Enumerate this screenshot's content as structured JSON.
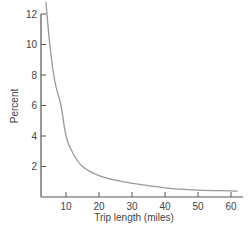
{
  "chart_data": {
    "type": "line",
    "title": "",
    "xlabel": "Trip length (miles)",
    "ylabel": "Percent",
    "xlim": [
      2.4,
      62
    ],
    "ylim": [
      0,
      12.5
    ],
    "x_ticks": [
      10,
      20,
      30,
      40,
      50,
      60
    ],
    "y_ticks": [
      2,
      4,
      6,
      8,
      10,
      12
    ],
    "grid": false,
    "legend": null,
    "series": [
      {
        "name": "Trip length distribution",
        "x": [
          3.9,
          5,
          6,
          7,
          8.5,
          10,
          12,
          15,
          20,
          25,
          30,
          40,
          50,
          60,
          62
        ],
        "y": [
          12.8,
          10.2,
          8.4,
          7.2,
          6.0,
          4.0,
          2.9,
          2.0,
          1.4,
          1.1,
          0.9,
          0.6,
          0.45,
          0.4,
          0.38
        ]
      }
    ]
  },
  "colors": {
    "axis": "#555555",
    "curve": "#999999",
    "text": "#444444"
  }
}
